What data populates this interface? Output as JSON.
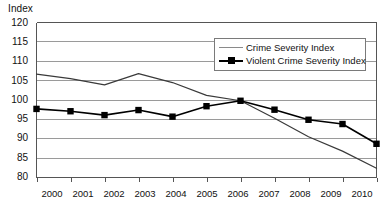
{
  "axis": {
    "y_title": "Index",
    "y_ticks": [
      "120",
      "115",
      "110",
      "105",
      "100",
      "95",
      "90",
      "85",
      "80"
    ],
    "x_ticks": [
      "2000",
      "2001",
      "2002",
      "2003",
      "2004",
      "2005",
      "2006",
      "2007",
      "2008",
      "2009",
      "2010"
    ]
  },
  "legend": {
    "entries": [
      {
        "label": "Crime Severity Index",
        "marker": "line-gray"
      },
      {
        "label": "Violent Crime Severity Index",
        "marker": "line-black-square"
      }
    ]
  },
  "colors": {
    "crime_severity_line": "#3a3a3a",
    "violent_line": "#000000",
    "violent_marker": "#000000",
    "gridline": "#9a9a9a",
    "axis": "#555555",
    "legend_border": "#7a7a7a",
    "legend_gray_swatch": "#8a8a8a",
    "background": "#ffffff"
  },
  "chart_data": {
    "type": "line",
    "title": "",
    "subtitle": "",
    "xlabel": "",
    "ylabel": "Index",
    "x": [
      2000,
      2001,
      2002,
      2003,
      2004,
      2005,
      2006,
      2007,
      2008,
      2009,
      2010
    ],
    "categories": [
      "2000",
      "2001",
      "2002",
      "2003",
      "2004",
      "2005",
      "2006",
      "2007",
      "2008",
      "2009",
      "2010"
    ],
    "ylim": [
      80,
      120
    ],
    "yticks": [
      80,
      85,
      90,
      95,
      100,
      105,
      110,
      115,
      120
    ],
    "grid": true,
    "grid_axis": "y",
    "legend_position": "top-right-inside",
    "series": [
      {
        "name": "Crime Severity Index",
        "marker": "none",
        "color": "#3a3a3a",
        "values": [
          106.7,
          105.5,
          103.9,
          106.8,
          104.5,
          101.2,
          99.8,
          95.3,
          90.5,
          86.8,
          82.4
        ]
      },
      {
        "name": "Violent Crime Severity Index",
        "marker": "square",
        "color": "#000000",
        "values": [
          97.7,
          97.1,
          96.1,
          97.4,
          95.7,
          98.4,
          99.8,
          97.5,
          94.9,
          93.8,
          88.7
        ]
      }
    ]
  }
}
